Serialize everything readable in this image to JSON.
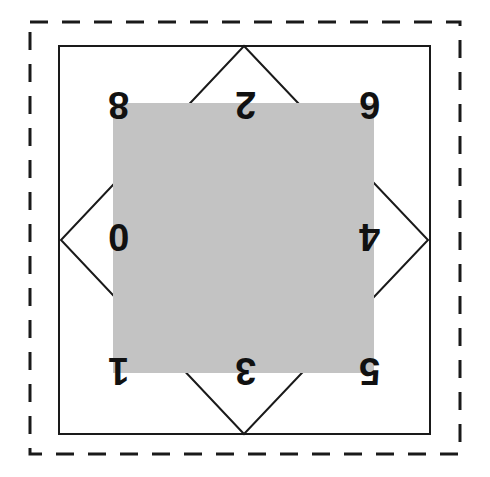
{
  "figure": {
    "canvas": {
      "width": 490,
      "height": 477,
      "background": "#ffffff"
    },
    "outer_dashed_square": {
      "name": "outer-dashed-boundary",
      "x": 30,
      "y": 22,
      "width": 430,
      "height": 432,
      "stroke": "#1a1a1a",
      "stroke_width": 3,
      "dash": "18 14",
      "fill": "none"
    },
    "inner_solid_square": {
      "name": "inner-solid-square",
      "x": 59,
      "y": 46,
      "width": 371,
      "height": 388,
      "stroke": "#1a1a1a",
      "stroke_width": 2,
      "fill": "none"
    },
    "diamond": {
      "name": "inscribed-diamond",
      "points": "244,46 428,240 244,434 61,240",
      "stroke": "#1a1a1a",
      "stroke_width": 2,
      "fill": "none"
    },
    "gray_overlay_square": {
      "name": "gray-occluding-square",
      "x": 113,
      "y": 103,
      "width": 261,
      "height": 270,
      "fill": "#c3c3c3",
      "stroke": "none"
    },
    "labels": [
      {
        "id": "label-top-left",
        "text": "8",
        "x": 108,
        "y": 86,
        "size": 38,
        "rotate": 180
      },
      {
        "id": "label-top-center",
        "text": "2",
        "x": 235,
        "y": 86,
        "size": 38,
        "rotate": 180
      },
      {
        "id": "label-top-right",
        "text": "6",
        "x": 359,
        "y": 86,
        "size": 38,
        "rotate": 180
      },
      {
        "id": "label-middle-left",
        "text": "0",
        "x": 108,
        "y": 218,
        "size": 38,
        "rotate": 180
      },
      {
        "id": "label-middle-right",
        "text": "4",
        "x": 359,
        "y": 218,
        "size": 38,
        "rotate": 180
      },
      {
        "id": "label-bottom-left",
        "text": "1",
        "x": 108,
        "y": 352,
        "size": 38,
        "rotate": 180
      },
      {
        "id": "label-bottom-center",
        "text": "3",
        "x": 235,
        "y": 352,
        "size": 38,
        "rotate": 180
      },
      {
        "id": "label-bottom-right",
        "text": "5",
        "x": 359,
        "y": 352,
        "size": 38,
        "rotate": 180
      }
    ],
    "colors": {
      "stroke": "#1a1a1a",
      "gray_fill": "#c3c3c3",
      "background": "#ffffff",
      "label": "#111111"
    }
  }
}
